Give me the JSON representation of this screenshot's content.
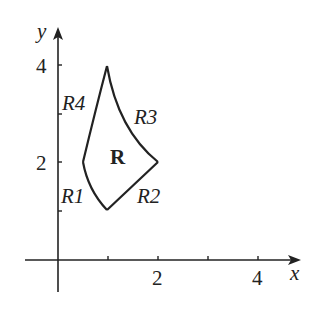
{
  "diagram": {
    "type": "region-in-plane",
    "axes": {
      "x_label": "x",
      "y_label": "y",
      "x_tick_labels": [
        "2",
        "4"
      ],
      "y_tick_labels": [
        "2",
        "4"
      ],
      "x_ticks": [
        1,
        2,
        3,
        4
      ],
      "y_ticks": [
        1,
        2,
        3,
        4
      ]
    },
    "region": {
      "label": "R",
      "vertices": [
        [
          1,
          4
        ],
        [
          0.5,
          2
        ],
        [
          1,
          1
        ],
        [
          2,
          2
        ]
      ],
      "boundary_labels": [
        "R1",
        "R2",
        "R3",
        "R4"
      ]
    },
    "colors": {
      "stroke": "#222222",
      "background": "#ffffff"
    }
  }
}
